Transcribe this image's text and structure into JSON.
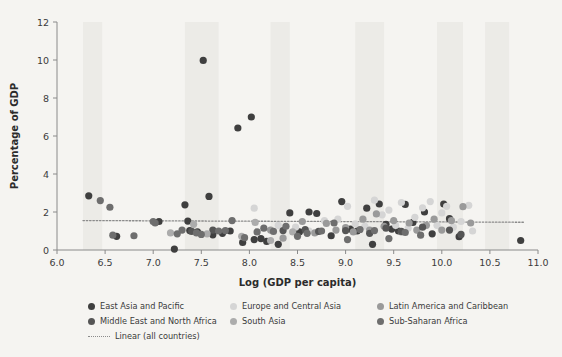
{
  "chart_data": {
    "type": "scatter",
    "title": "",
    "xlabel": "Log (GDP per capita)",
    "ylabel": "Percentage of GDP",
    "xlim": [
      6.0,
      11.0
    ],
    "ylim": [
      0,
      12
    ],
    "xticks": [
      "6.0",
      "6.5",
      "7.0",
      "7.5",
      "8.0",
      "8.5",
      "9.0",
      "9.5",
      "10.0",
      "10.5",
      "11.0"
    ],
    "xtick_values": [
      6.0,
      6.5,
      7.0,
      7.5,
      8.0,
      8.5,
      9.0,
      9.5,
      10.0,
      10.5,
      11.0
    ],
    "yticks": [
      "0",
      "2",
      "4",
      "6",
      "8",
      "10",
      "12"
    ],
    "ytick_values": [
      0,
      2,
      4,
      6,
      8,
      10,
      12
    ],
    "grid": false,
    "legend_position": "bottom",
    "colors": {
      "east_asia_and_pacific": "#3f3f3f",
      "europe_and_central_asia": "#d5d5d5",
      "latin_america_and_caribbean": "#9a9a9a",
      "middle_east_and_north_africa": "#555555",
      "south_asia": "#acacac",
      "sub_saharan_africa": "#6e6e6e",
      "trendline": "#8b8b8b",
      "axis": "#8a8a8a",
      "background": "#f5f4f1",
      "band": "#ecebe7"
    },
    "trendline": {
      "name": "Linear (all countries)",
      "style": "dotted",
      "x_start": 6.27,
      "x_end": 10.85,
      "y_start": 1.55,
      "y_end": 1.46
    },
    "series": [
      {
        "name": "East Asia and Pacific",
        "color": "#3f3f3f",
        "points": [
          [
            6.33,
            2.85
          ],
          [
            6.62,
            0.72
          ],
          [
            7.06,
            1.5
          ],
          [
            7.22,
            0.05
          ],
          [
            7.33,
            2.38
          ],
          [
            7.36,
            1.52
          ],
          [
            7.38,
            1.02
          ],
          [
            7.46,
            0.95
          ],
          [
            7.52,
            9.98
          ],
          [
            7.58,
            2.82
          ],
          [
            7.62,
            0.8
          ],
          [
            7.72,
            0.88
          ],
          [
            7.8,
            1.0
          ],
          [
            7.88,
            6.42
          ],
          [
            7.93,
            0.4
          ],
          [
            8.02,
            7.0
          ],
          [
            8.05,
            0.55
          ],
          [
            8.12,
            0.6
          ],
          [
            8.18,
            0.45
          ],
          [
            8.3,
            0.3
          ],
          [
            8.42,
            1.95
          ],
          [
            8.52,
            0.95
          ],
          [
            8.62,
            2.0
          ],
          [
            8.7,
            1.92
          ],
          [
            8.85,
            0.75
          ],
          [
            8.96,
            2.55
          ],
          [
            9.05,
            1.1
          ],
          [
            9.12,
            1.0
          ],
          [
            9.22,
            2.2
          ],
          [
            9.28,
            0.3
          ],
          [
            9.35,
            2.42
          ],
          [
            9.42,
            1.35
          ],
          [
            9.48,
            1.1
          ],
          [
            9.55,
            1.0
          ],
          [
            9.62,
            2.4
          ],
          [
            9.7,
            1.45
          ],
          [
            9.82,
            2.0
          ],
          [
            9.9,
            0.85
          ],
          [
            10.02,
            2.42
          ],
          [
            10.08,
            1.65
          ],
          [
            10.18,
            0.7
          ],
          [
            10.82,
            0.5
          ]
        ]
      },
      {
        "name": "Europe and Central Asia",
        "color": "#d5d5d5",
        "points": [
          [
            8.05,
            2.2
          ],
          [
            8.3,
            1.3
          ],
          [
            8.48,
            1.2
          ],
          [
            8.62,
            1.0
          ],
          [
            8.78,
            1.55
          ],
          [
            8.92,
            1.62
          ],
          [
            9.02,
            2.3
          ],
          [
            9.1,
            1.38
          ],
          [
            9.2,
            1.25
          ],
          [
            9.3,
            2.62
          ],
          [
            9.38,
            1.85
          ],
          [
            9.45,
            2.1
          ],
          [
            9.52,
            1.3
          ],
          [
            9.58,
            2.5
          ],
          [
            9.65,
            1.15
          ],
          [
            9.72,
            1.72
          ],
          [
            9.8,
            2.22
          ],
          [
            9.88,
            2.55
          ],
          [
            9.95,
            1.3
          ],
          [
            10.0,
            1.95
          ],
          [
            10.05,
            2.3
          ],
          [
            10.12,
            1.2
          ],
          [
            10.2,
            1.5
          ],
          [
            10.28,
            2.35
          ],
          [
            10.32,
            1.0
          ]
        ]
      },
      {
        "name": "Latin America and Caribbean",
        "color": "#9a9a9a",
        "points": [
          [
            8.22,
            1.05
          ],
          [
            8.35,
            0.62
          ],
          [
            8.55,
            1.5
          ],
          [
            8.68,
            0.9
          ],
          [
            8.8,
            1.4
          ],
          [
            8.9,
            1.05
          ],
          [
            9.0,
            1.18
          ],
          [
            9.08,
            0.95
          ],
          [
            9.18,
            1.62
          ],
          [
            9.25,
            1.05
          ],
          [
            9.32,
            1.9
          ],
          [
            9.4,
            1.25
          ],
          [
            9.5,
            1.55
          ],
          [
            9.58,
            0.95
          ],
          [
            9.66,
            1.42
          ],
          [
            9.74,
            1.05
          ],
          [
            9.84,
            1.3
          ],
          [
            9.92,
            1.62
          ],
          [
            10.0,
            1.05
          ],
          [
            10.1,
            1.55
          ],
          [
            10.22,
            2.28
          ],
          [
            10.3,
            1.42
          ]
        ]
      },
      {
        "name": "Middle East and North Africa",
        "color": "#555555",
        "points": [
          [
            7.4,
            0.98
          ],
          [
            7.62,
            1.05
          ],
          [
            8.35,
            1.02
          ],
          [
            8.58,
            1.08
          ],
          [
            8.72,
            0.98
          ],
          [
            9.0,
            1.02
          ],
          [
            9.25,
            0.88
          ],
          [
            9.42,
            1.15
          ],
          [
            9.58,
            0.98
          ],
          [
            9.8,
            1.2
          ],
          [
            10.08,
            1.05
          ],
          [
            10.2,
            0.82
          ]
        ]
      },
      {
        "name": "South Asia",
        "color": "#acacac",
        "points": [
          [
            7.18,
            0.9
          ],
          [
            7.42,
            1.35
          ],
          [
            7.56,
            0.85
          ],
          [
            7.92,
            0.72
          ],
          [
            8.06,
            1.45
          ],
          [
            8.22,
            0.5
          ],
          [
            8.45,
            0.95
          ]
        ]
      },
      {
        "name": "Sub-Saharan Africa",
        "color": "#6e6e6e",
        "points": [
          [
            6.45,
            2.6
          ],
          [
            6.55,
            2.25
          ],
          [
            6.58,
            0.78
          ],
          [
            6.8,
            0.75
          ],
          [
            7.0,
            1.5
          ],
          [
            7.02,
            1.42
          ],
          [
            7.25,
            0.85
          ],
          [
            7.3,
            1.05
          ],
          [
            7.45,
            0.9
          ],
          [
            7.5,
            0.82
          ],
          [
            7.68,
            1.0
          ],
          [
            7.75,
            1.02
          ],
          [
            7.82,
            1.55
          ],
          [
            7.95,
            0.65
          ],
          [
            8.08,
            0.95
          ],
          [
            8.15,
            1.15
          ],
          [
            8.25,
            0.98
          ],
          [
            8.38,
            1.25
          ],
          [
            8.5,
            0.72
          ],
          [
            8.6,
            0.88
          ],
          [
            8.75,
            1.0
          ],
          [
            8.88,
            1.42
          ],
          [
            9.02,
            0.55
          ],
          [
            9.15,
            1.08
          ],
          [
            9.3,
            1.02
          ],
          [
            9.45,
            0.6
          ],
          [
            9.62,
            0.92
          ],
          [
            9.78,
            0.78
          ]
        ]
      }
    ],
    "background_bands": [
      {
        "x_start": 6.27,
        "x_end": 6.47
      },
      {
        "x_start": 7.33,
        "x_end": 7.68
      },
      {
        "x_start": 8.22,
        "x_end": 8.42
      },
      {
        "x_start": 9.1,
        "x_end": 9.4
      },
      {
        "x_start": 9.95,
        "x_end": 10.22
      },
      {
        "x_start": 10.45,
        "x_end": 10.7
      }
    ]
  },
  "legend": {
    "rows": [
      [
        {
          "label": "East Asia and Pacific",
          "marker": "dot",
          "color": "#3f3f3f",
          "cls": "li-a"
        },
        {
          "label": "Europe and Central Asia",
          "marker": "dot",
          "color": "#d5d5d5",
          "cls": "li-b"
        },
        {
          "label": "Latin America and Caribbean",
          "marker": "dot",
          "color": "#9a9a9a",
          "cls": "li-c"
        }
      ],
      [
        {
          "label": "Middle East and North Africa",
          "marker": "dot",
          "color": "#555555",
          "cls": "li-a"
        },
        {
          "label": "South Asia",
          "marker": "dot",
          "color": "#acacac",
          "cls": "li-b"
        },
        {
          "label": "Sub-Saharan Africa",
          "marker": "dot",
          "color": "#6e6e6e",
          "cls": "li-c"
        }
      ],
      [
        {
          "label": "Linear (all countries)",
          "marker": "dash",
          "color": "#8b8b8b",
          "cls": "li-a"
        }
      ]
    ]
  }
}
